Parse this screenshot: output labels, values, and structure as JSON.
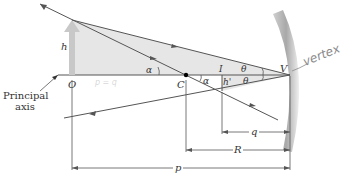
{
  "diagram": {
    "labels": {
      "principal_axis_line1": "Principal",
      "principal_axis_line2": "axis",
      "object_point": "O",
      "center_of_curvature": "C",
      "image_point": "I",
      "vertex": "V",
      "object_height": "h",
      "image_height": "h'",
      "angle_alpha_1": "α",
      "angle_alpha_2": "α",
      "angle_theta_top": "θ",
      "angle_theta_bottom": "θ",
      "distance_q": "q",
      "distance_R": "R",
      "distance_p": "p"
    },
    "annotations": {
      "handwritten_vertex": "vertex",
      "handwritten_faint": "p = q"
    },
    "colors": {
      "line": "#555555",
      "triangle_fill": "#e3e3e3",
      "object_arrow": "#c8c8c8",
      "mirror": "#bcbcbc",
      "handwriting": "#8a8a8a"
    }
  }
}
